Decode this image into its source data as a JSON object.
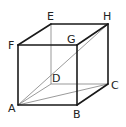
{
  "diagram": {
    "vertices": {
      "A": {
        "label": "A",
        "x": 18,
        "y": 105
      },
      "B": {
        "label": "B",
        "x": 77,
        "y": 105
      },
      "C": {
        "label": "C",
        "x": 108,
        "y": 84
      },
      "D": {
        "label": "D",
        "x": 51,
        "y": 84
      },
      "E": {
        "label": "E",
        "x": 51,
        "y": 24
      },
      "F": {
        "label": "F",
        "x": 18,
        "y": 45
      },
      "G": {
        "label": "G",
        "x": 77,
        "y": 45
      },
      "H": {
        "label": "H",
        "x": 108,
        "y": 24
      }
    },
    "visible_edges": [
      "AB",
      "BC",
      "CH",
      "HE",
      "EF",
      "FA",
      "FG",
      "GH",
      "GB"
    ],
    "hidden_edges": [
      "ED",
      "DC",
      "AD"
    ],
    "diagonals": [
      "AH",
      "AC"
    ],
    "labels": {
      "A": "A",
      "B": "B",
      "C": "C",
      "D": "D",
      "E": "E",
      "F": "F",
      "G": "G",
      "H": "H"
    }
  }
}
